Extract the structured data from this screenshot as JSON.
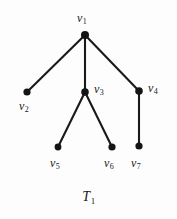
{
  "figure": {
    "caption": "T",
    "caption_sub": "1",
    "background_color": "#fdfdfd",
    "ink_color": "#1a1a1a",
    "width": 177,
    "height": 219
  },
  "chart_data": {
    "type": "diagram",
    "diagram_kind": "tree-graph",
    "title": "T1",
    "nodes": [
      {
        "id": "v1",
        "label": "v",
        "sub": "1",
        "x": 85,
        "y": 35,
        "label_x": 77,
        "label_y": 12,
        "radius": 4.0
      },
      {
        "id": "v2",
        "label": "v",
        "sub": "2",
        "x": 27,
        "y": 92,
        "label_x": 19,
        "label_y": 100,
        "radius": 3.6
      },
      {
        "id": "v3",
        "label": "v",
        "sub": "3",
        "x": 85,
        "y": 92,
        "label_x": 94,
        "label_y": 83,
        "radius": 3.8
      },
      {
        "id": "v4",
        "label": "v",
        "sub": "4",
        "x": 139,
        "y": 91,
        "label_x": 148,
        "label_y": 82,
        "radius": 3.8
      },
      {
        "id": "v5",
        "label": "v",
        "sub": "5",
        "x": 58,
        "y": 147,
        "label_x": 50,
        "label_y": 157,
        "radius": 3.4
      },
      {
        "id": "v6",
        "label": "v",
        "sub": "6",
        "x": 112,
        "y": 147,
        "label_x": 104,
        "label_y": 157,
        "radius": 3.6
      },
      {
        "id": "v7",
        "label": "v",
        "sub": "7",
        "x": 139,
        "y": 146,
        "label_x": 131,
        "label_y": 157,
        "radius": 3.6
      }
    ],
    "edges": [
      {
        "from": "v1",
        "to": "v2"
      },
      {
        "from": "v1",
        "to": "v3"
      },
      {
        "from": "v1",
        "to": "v4"
      },
      {
        "from": "v3",
        "to": "v5"
      },
      {
        "from": "v3",
        "to": "v6"
      },
      {
        "from": "v4",
        "to": "v7"
      }
    ],
    "edge_width": 2.1,
    "node_color": "#141414",
    "edge_color": "#1a1a1a"
  }
}
